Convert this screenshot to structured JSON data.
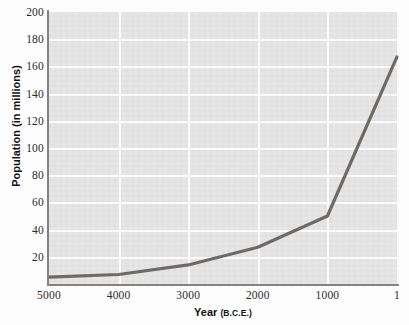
{
  "chart_data": {
    "type": "line",
    "title": "",
    "subtitle": "",
    "xlabel": "Year",
    "xlabel_suffix": "(B.C.E.)",
    "ylabel": "Population (in millions)",
    "xlim": [
      5000,
      0
    ],
    "ylim": [
      0,
      200
    ],
    "x_reversed": true,
    "grid": true,
    "grid_color": "#fafafa",
    "plot_background": "#e4e4e4",
    "legend": null,
    "legend_position": "none",
    "series": [
      {
        "name": "World population",
        "color": "#6e6a66",
        "x": [
          5000,
          4000,
          3000,
          2000,
          1000,
          1
        ],
        "values": [
          5,
          7,
          14,
          27,
          50,
          167
        ]
      }
    ],
    "x_ticks": [
      {
        "value": 5000,
        "label": "5000"
      },
      {
        "value": 4000,
        "label": "4000"
      },
      {
        "value": 3000,
        "label": "3000"
      },
      {
        "value": 2000,
        "label": "2000"
      },
      {
        "value": 1000,
        "label": "1000"
      },
      {
        "value": 1,
        "label": "1"
      }
    ],
    "y_ticks": [
      {
        "value": 200,
        "label": "200"
      },
      {
        "value": 180,
        "label": "180"
      },
      {
        "value": 160,
        "label": "160"
      },
      {
        "value": 140,
        "label": "140"
      },
      {
        "value": 120,
        "label": "120"
      },
      {
        "value": 100,
        "label": "100"
      },
      {
        "value": 80,
        "label": "80"
      },
      {
        "value": 60,
        "label": "60"
      },
      {
        "value": 40,
        "label": "40"
      },
      {
        "value": 20,
        "label": "20"
      }
    ],
    "annotations": []
  }
}
